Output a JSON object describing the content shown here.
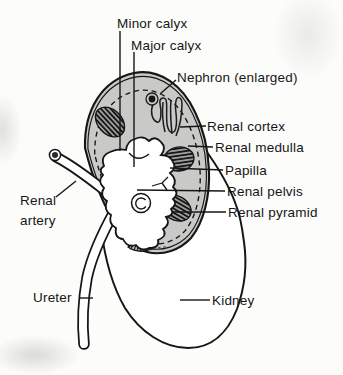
{
  "figure": {
    "type": "anatomical-diagram",
    "labels": {
      "minor_calyx": "Minor calyx",
      "major_calyx": "Major calyx",
      "nephron": "Nephron (enlarged)",
      "renal_cortex": "Renal cortex",
      "renal_medulla": "Renal medulla",
      "papilla": "Papilla",
      "renal_pelvis": "Renal pelvis",
      "renal_pyramid": "Renal pyramid",
      "renal_artery": {
        "line1": "Renal",
        "line2": "artery"
      },
      "ureter": "Ureter",
      "kidney": "Kidney"
    },
    "colors": {
      "ink": "#161616",
      "cortex_fill": "#c9c9c7",
      "paper": "#fcfcfa"
    }
  }
}
